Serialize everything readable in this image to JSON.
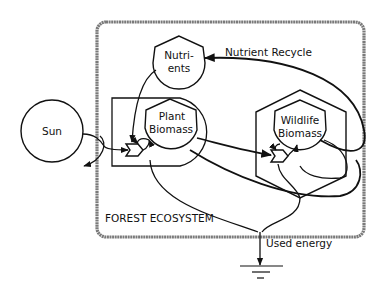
{
  "diagram": {
    "type": "energy-systems-diagram",
    "system_label": "FOREST ECOSYSTEM",
    "source": {
      "label": "Sun"
    },
    "storages": [
      {
        "id": "nutrients",
        "label_lines": [
          "Nutri-",
          "ents"
        ]
      },
      {
        "id": "plant-biomass",
        "label_lines": [
          "Plant",
          "Biomass"
        ],
        "role": "producer"
      },
      {
        "id": "wildlife-biomass",
        "label_lines": [
          "Wildlife",
          "Biomass"
        ],
        "role": "consumer"
      }
    ],
    "annotations": {
      "nutrient_recycle": "Nutrient Recycle",
      "used_energy": "Used energy"
    },
    "flows": [
      {
        "from": "Sun",
        "to": "Plant Biomass"
      },
      {
        "from": "Nutrients",
        "to": "Plant Biomass"
      },
      {
        "from": "Plant Biomass",
        "to": "Wildlife Biomass"
      },
      {
        "from": "Wildlife Biomass",
        "to": "Nutrients",
        "label": "Nutrient Recycle"
      },
      {
        "from": "Plant Biomass",
        "to": "Heat sink",
        "label": "Used energy"
      },
      {
        "from": "Wildlife Biomass",
        "to": "Heat sink",
        "label": "Used energy"
      }
    ]
  }
}
